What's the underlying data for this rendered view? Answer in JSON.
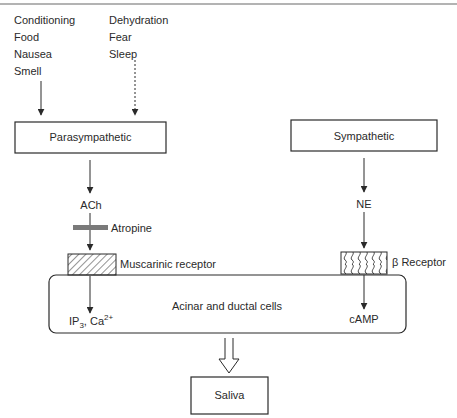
{
  "stimuli": {
    "left": [
      "Conditioning",
      "Food",
      "Nausea",
      "Smell"
    ],
    "right": [
      "Dehydration",
      "Fear",
      "Sleep"
    ]
  },
  "nodes": {
    "parasympathetic": "Parasympathetic",
    "sympathetic": "Sympathetic",
    "ach": "ACh",
    "ne": "NE",
    "atropine": "Atropine",
    "muscarinic_receptor": "Muscarinic receptor",
    "beta_receptor": "β Receptor",
    "cells": "Acinar and ductal cells",
    "ip3_base": "IP",
    "ip3_sub": "3",
    "ip3_sep": ", Ca",
    "ca_sup": "2+",
    "camp": "cAMP",
    "saliva": "Saliva"
  },
  "colors": {
    "line": "#2a2a2a",
    "atropine_bar": "#7a7a7a",
    "border": "#9a9a9a"
  }
}
